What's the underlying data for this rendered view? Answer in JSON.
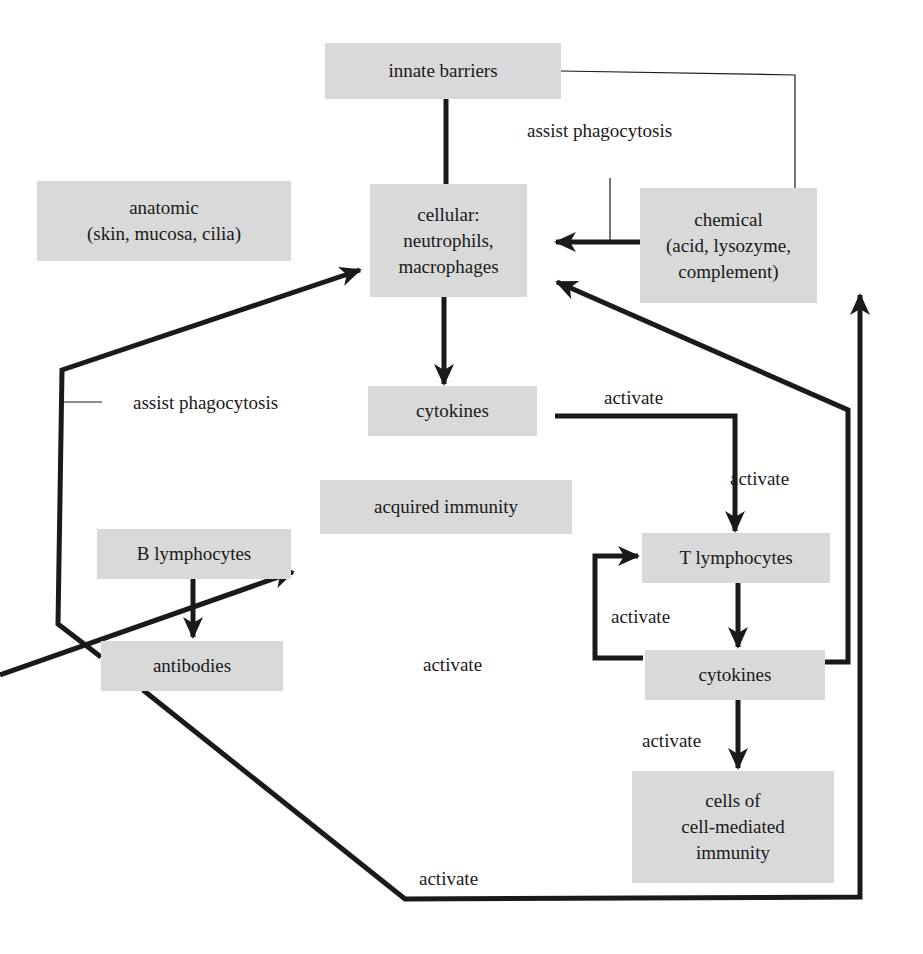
{
  "diagram": {
    "nodes": {
      "innate_barriers": "innate barriers",
      "anatomic": "anatomic\n(skin, mucosa, cilia)",
      "cellular": "cellular:\nneutrophils,\nmacrophages",
      "chemical": "chemical\n(acid, lysozyme,\ncomplement)",
      "cytokines_innate": "cytokines",
      "acquired_immunity": "acquired immunity",
      "b_lymphocytes": "B lymphocytes",
      "antibodies": "antibodies",
      "t_lymphocytes": "T lymphocytes",
      "cytokines_acquired": "cytokines",
      "cell_mediated": "cells of\ncell-mediated\nimmunity"
    },
    "edge_labels": {
      "assist_top": "assist phagocytosis",
      "assist_left": "assist phagocytosis",
      "activate_cyt_t_horiz": "activate",
      "activate_cyt_t_vert": "activate",
      "activate_loop": "activate",
      "activate_b": "activate",
      "activate_cmi": "activate",
      "activate_bottom": "activate"
    },
    "colors": {
      "box": "#d9d9d9",
      "line": "#1a1a1a"
    }
  }
}
